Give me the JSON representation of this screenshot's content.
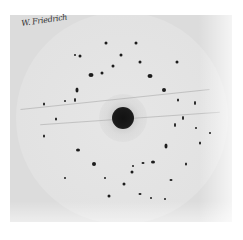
{
  "image": {
    "description": "Laue X-ray diffraction photograph",
    "signature": "W. Friedrich",
    "colors": {
      "background": "#ffffff",
      "plate": "#dcdcdc",
      "disc": "#e4e4e4",
      "spot": "#1c1c1c"
    },
    "plate": {
      "x": 10,
      "y": 15,
      "width": 222,
      "height": 207
    },
    "disc": {
      "cx": 122,
      "cy": 118,
      "r": 106
    },
    "central_beam": {
      "cx": 123,
      "cy": 118,
      "r": 11
    },
    "spots": [
      {
        "x": 106,
        "y": 43,
        "w": 3,
        "h": 3
      },
      {
        "x": 136,
        "y": 43,
        "w": 3,
        "h": 3
      },
      {
        "x": 80,
        "y": 56,
        "w": 3,
        "h": 3
      },
      {
        "x": 121,
        "y": 55,
        "w": 3,
        "h": 3
      },
      {
        "x": 140,
        "y": 62,
        "w": 3,
        "h": 3
      },
      {
        "x": 177,
        "y": 62,
        "w": 3,
        "h": 3
      },
      {
        "x": 113,
        "y": 66,
        "w": 3,
        "h": 3
      },
      {
        "x": 75,
        "y": 55,
        "w": 2,
        "h": 2
      },
      {
        "x": 91,
        "y": 75,
        "w": 5,
        "h": 4
      },
      {
        "x": 150,
        "y": 76,
        "w": 5,
        "h": 4
      },
      {
        "x": 102,
        "y": 73,
        "w": 3,
        "h": 3
      },
      {
        "x": 164,
        "y": 90,
        "w": 4,
        "h": 4
      },
      {
        "x": 77,
        "y": 90,
        "w": 3,
        "h": 5
      },
      {
        "x": 75,
        "y": 100,
        "w": 2,
        "h": 4
      },
      {
        "x": 65,
        "y": 101,
        "w": 2,
        "h": 2
      },
      {
        "x": 44,
        "y": 104,
        "w": 2,
        "h": 3
      },
      {
        "x": 195,
        "y": 103,
        "w": 2,
        "h": 4
      },
      {
        "x": 178,
        "y": 100,
        "w": 2,
        "h": 3
      },
      {
        "x": 56,
        "y": 119,
        "w": 2,
        "h": 3
      },
      {
        "x": 183,
        "y": 118,
        "w": 2,
        "h": 4
      },
      {
        "x": 175,
        "y": 125,
        "w": 2,
        "h": 4
      },
      {
        "x": 44,
        "y": 136,
        "w": 2,
        "h": 3
      },
      {
        "x": 78,
        "y": 150,
        "w": 4,
        "h": 3
      },
      {
        "x": 166,
        "y": 146,
        "w": 3,
        "h": 5
      },
      {
        "x": 200,
        "y": 143,
        "w": 2,
        "h": 3
      },
      {
        "x": 94,
        "y": 164,
        "w": 4,
        "h": 4
      },
      {
        "x": 153,
        "y": 162,
        "w": 4,
        "h": 3
      },
      {
        "x": 143,
        "y": 163,
        "w": 3,
        "h": 2
      },
      {
        "x": 133,
        "y": 166,
        "w": 2,
        "h": 2
      },
      {
        "x": 132,
        "y": 172,
        "w": 3,
        "h": 3
      },
      {
        "x": 186,
        "y": 164,
        "w": 2,
        "h": 3
      },
      {
        "x": 65,
        "y": 178,
        "w": 2,
        "h": 2
      },
      {
        "x": 105,
        "y": 178,
        "w": 2,
        "h": 2
      },
      {
        "x": 171,
        "y": 180,
        "w": 3,
        "h": 2
      },
      {
        "x": 124,
        "y": 184,
        "w": 3,
        "h": 3
      },
      {
        "x": 140,
        "y": 194,
        "w": 3,
        "h": 2
      },
      {
        "x": 109,
        "y": 196,
        "w": 3,
        "h": 3
      },
      {
        "x": 151,
        "y": 198,
        "w": 2,
        "h": 2
      },
      {
        "x": 165,
        "y": 199,
        "w": 2,
        "h": 2
      },
      {
        "x": 196,
        "y": 128,
        "w": 2,
        "h": 2
      },
      {
        "x": 210,
        "y": 133,
        "w": 2,
        "h": 2
      }
    ],
    "streaks": [
      {
        "x": 20,
        "y": 99,
        "w": 190,
        "angle": -6
      },
      {
        "x": 40,
        "y": 118,
        "w": 180,
        "angle": -4
      }
    ]
  }
}
